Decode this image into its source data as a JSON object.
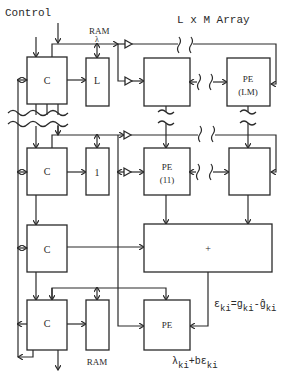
{
  "title": "L x M Array",
  "labels": {
    "control": "Control",
    "ram_top": "RAM",
    "lambda_top": "λ",
    "array_title": "L x M Array",
    "ram_bottom": "RAM",
    "error_eq_eps": "ε",
    "error_eq_sub1": "ki",
    "error_eq_mid": "=g",
    "error_eq_sub2": "ki",
    "error_eq_minus": "-ĝ",
    "error_eq_sub3": "ki",
    "update_eq_lambda": "λ",
    "update_eq_sub1": "ki",
    "update_eq_mid": "+bε",
    "update_eq_sub2": "ki"
  },
  "blocks": {
    "c1": "C",
    "l_block": "L",
    "pe_lm_1": "PE",
    "pe_lm_2": "(LM)",
    "c2": "C",
    "one_block": "1",
    "pe_11_1": "PE",
    "pe_11_2": "(11)",
    "c3": "C",
    "adder": "+",
    "c4": "C",
    "pe_bottom": "PE"
  }
}
